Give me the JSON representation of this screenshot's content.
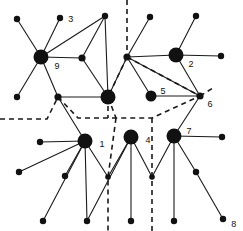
{
  "figure": {
    "width": 243,
    "height": 231,
    "background_color": "#ffffff",
    "ink_color": "#111111"
  },
  "graph_data": {
    "type": "node-link-diagram",
    "node_styles": {
      "hub": {
        "radius": 7.5,
        "fill": "#111111"
      },
      "medium": {
        "radius": 5.5,
        "fill": "#111111"
      },
      "small": {
        "radius": 3.6,
        "fill": "#111111"
      },
      "terminal": {
        "radius": 3.2,
        "fill": "#111111"
      },
      "junction": {
        "radius": 2.8,
        "fill": "#111111"
      }
    },
    "nodes": [
      {
        "id": "n9",
        "label": "9",
        "x": 41,
        "y": 57,
        "style": "hub",
        "label_dx": 6,
        "label_dy": 9
      },
      {
        "id": "n2",
        "label": "2",
        "x": 176,
        "y": 55,
        "style": "hub",
        "label_dx": 5,
        "label_dy": 9
      },
      {
        "id": "n1",
        "label": "1",
        "x": 85,
        "y": 141,
        "style": "hub",
        "label_dx": 7,
        "label_dy": 3
      },
      {
        "id": "n4",
        "label": "4",
        "x": 131,
        "y": 137,
        "style": "hub",
        "label_dx": 7,
        "label_dy": 3
      },
      {
        "id": "n7",
        "label": "7",
        "x": 174,
        "y": 136,
        "style": "hub",
        "label_dx": 5,
        "label_dy": -5
      },
      {
        "id": "nC",
        "label": "",
        "x": 108,
        "y": 97,
        "style": "hub",
        "label_dx": 0,
        "label_dy": 0
      },
      {
        "id": "n5",
        "label": "5",
        "x": 151,
        "y": 96,
        "style": "medium",
        "label_dx": 4,
        "label_dy": -5
      },
      {
        "id": "n6",
        "label": "6",
        "x": 200,
        "y": 96,
        "style": "small",
        "label_dx": 4,
        "label_dy": 8
      },
      {
        "id": "nJ1",
        "label": "",
        "x": 127,
        "y": 57,
        "style": "small",
        "label_dx": 0,
        "label_dy": 0
      },
      {
        "id": "nJ2",
        "label": "",
        "x": 58,
        "y": 97,
        "style": "small",
        "label_dx": 0,
        "label_dy": 0
      },
      {
        "id": "nJ3",
        "label": "",
        "x": 82,
        "y": 58,
        "style": "small",
        "label_dx": 0,
        "label_dy": 0
      },
      {
        "id": "nJ4",
        "label": "",
        "x": 108,
        "y": 177,
        "style": "junction",
        "label_dx": 0,
        "label_dy": 0
      },
      {
        "id": "nJ5",
        "label": "",
        "x": 152,
        "y": 177,
        "style": "junction",
        "label_dx": 0,
        "label_dy": 0
      },
      {
        "id": "t3",
        "label": "3",
        "x": 60,
        "y": 18,
        "style": "terminal",
        "label_dx": 5,
        "label_dy": 1
      },
      {
        "id": "t8",
        "label": "8",
        "x": 223,
        "y": 219,
        "style": "terminal",
        "label_dx": 5,
        "label_dy": 5
      },
      {
        "id": "tA",
        "label": "",
        "x": 17,
        "y": 19,
        "style": "terminal",
        "label_dx": 0,
        "label_dy": 0
      },
      {
        "id": "tB",
        "label": "",
        "x": 105,
        "y": 16,
        "style": "terminal",
        "label_dx": 0,
        "label_dy": 0
      },
      {
        "id": "tC",
        "label": "",
        "x": 150,
        "y": 17,
        "style": "terminal",
        "label_dx": 0,
        "label_dy": 0
      },
      {
        "id": "tD",
        "label": "",
        "x": 196,
        "y": 16,
        "style": "terminal",
        "label_dx": 0,
        "label_dy": 0
      },
      {
        "id": "tE",
        "label": "",
        "x": 221,
        "y": 56,
        "style": "terminal",
        "label_dx": 0,
        "label_dy": 0
      },
      {
        "id": "tF",
        "label": "",
        "x": 222,
        "y": 137,
        "style": "terminal",
        "label_dx": 0,
        "label_dy": 0
      },
      {
        "id": "tG",
        "label": "",
        "x": 17,
        "y": 97,
        "style": "terminal",
        "label_dx": 0,
        "label_dy": 0
      },
      {
        "id": "tH",
        "label": "",
        "x": 40,
        "y": 142,
        "style": "terminal",
        "label_dx": 0,
        "label_dy": 0
      },
      {
        "id": "tI",
        "label": "",
        "x": 19,
        "y": 172,
        "style": "terminal",
        "label_dx": 0,
        "label_dy": 0
      },
      {
        "id": "tJ",
        "label": "",
        "x": 65,
        "y": 176,
        "style": "terminal",
        "label_dx": 0,
        "label_dy": 0
      },
      {
        "id": "tK",
        "label": "",
        "x": 43,
        "y": 221,
        "style": "terminal",
        "label_dx": 0,
        "label_dy": 0
      },
      {
        "id": "tL",
        "label": "",
        "x": 87,
        "y": 221,
        "style": "terminal",
        "label_dx": 0,
        "label_dy": 0
      },
      {
        "id": "tM",
        "label": "",
        "x": 131,
        "y": 221,
        "style": "terminal",
        "label_dx": 0,
        "label_dy": 0
      },
      {
        "id": "tN",
        "label": "",
        "x": 174,
        "y": 221,
        "style": "terminal",
        "label_dx": 0,
        "label_dy": 0
      },
      {
        "id": "tO",
        "label": "",
        "x": 196,
        "y": 172,
        "style": "terminal",
        "label_dx": 0,
        "label_dy": 0
      }
    ],
    "solid_edges": [
      [
        "n9",
        "tA"
      ],
      [
        "n9",
        "t3"
      ],
      [
        "n9",
        "tB"
      ],
      [
        "n9",
        "nJ3"
      ],
      [
        "n9",
        "tG"
      ],
      [
        "n9",
        "nJ2"
      ],
      [
        "nJ3",
        "tB"
      ],
      [
        "nJ3",
        "nC"
      ],
      [
        "tB",
        "nC"
      ],
      [
        "nJ2",
        "nC"
      ],
      [
        "nJ2",
        "n1"
      ],
      [
        "nC",
        "nJ1"
      ],
      [
        "nJ1",
        "tC"
      ],
      [
        "nJ1",
        "n2"
      ],
      [
        "nJ1",
        "n5"
      ],
      [
        "nJ1",
        "n6"
      ],
      [
        "n2",
        "tD"
      ],
      [
        "n2",
        "tE"
      ],
      [
        "n2",
        "n6"
      ],
      [
        "n5",
        "n6"
      ],
      [
        "n6",
        "n7"
      ],
      [
        "n1",
        "tH"
      ],
      [
        "n1",
        "tI"
      ],
      [
        "n1",
        "tJ"
      ],
      [
        "n1",
        "tK"
      ],
      [
        "n1",
        "tL"
      ],
      [
        "n1",
        "nJ4"
      ],
      [
        "n4",
        "nJ4"
      ],
      [
        "n4",
        "tM"
      ],
      [
        "n4",
        "nJ5"
      ],
      [
        "n4",
        "tL"
      ],
      [
        "n7",
        "nJ5"
      ],
      [
        "n7",
        "tF"
      ],
      [
        "n7",
        "tN"
      ],
      [
        "n7",
        "tO"
      ],
      [
        "tO",
        "t8"
      ]
    ],
    "dashed_boundary_paths": [
      "M 127 0 L 127 57",
      "M 127 57 L 200 96",
      "M 200 96 L 213 88",
      "M 127 57 L 108 97 L 116 118 L 152 118 L 200 96",
      "M 0 119 L 47 119 L 58 97",
      "M 58 97 L 78 118 L 116 118",
      "M 108 97 L 108 118",
      "M 116 118 L 108 177 L 108 231",
      "M 152 118 L 152 177 L 152 231"
    ],
    "labels": [
      "9",
      "3",
      "2",
      "5",
      "6",
      "1",
      "4",
      "7",
      "8"
    ]
  }
}
